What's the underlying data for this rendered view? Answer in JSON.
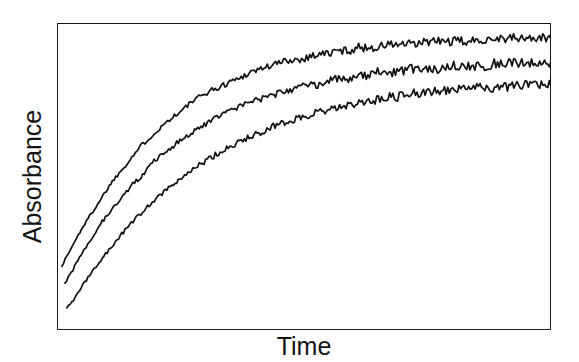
{
  "chart_data": {
    "type": "line",
    "title": "",
    "subtitle": "",
    "xlabel": "Time",
    "ylabel": "Absorbance",
    "xlim": [
      0,
      100
    ],
    "ylim": [
      0,
      100
    ],
    "grid": false,
    "legend": "none",
    "axis_ticks": "none",
    "annotations": [],
    "series": [
      {
        "name": "curve-1-upper",
        "color": "#111111",
        "plateau": 94,
        "rate": 0.052,
        "x_start": 1.0,
        "y_start": 21,
        "x": [
          1,
          3,
          5,
          7,
          9,
          11,
          13,
          15,
          17,
          19,
          21,
          23,
          25,
          27,
          29,
          31,
          33,
          35,
          37,
          39,
          41,
          43,
          45,
          47,
          49,
          51,
          53,
          55,
          57,
          59,
          61,
          63,
          65,
          67,
          69,
          71,
          73,
          75,
          77,
          79,
          81,
          83,
          85,
          87,
          89,
          91,
          93,
          95,
          97,
          99,
          100
        ],
        "values": [
          21,
          27,
          33,
          38,
          43,
          48,
          52,
          56,
          60,
          63,
          66,
          69,
          71,
          74,
          76,
          78,
          79,
          81,
          82,
          84,
          85,
          86,
          87,
          88,
          88,
          89,
          90,
          90,
          91,
          91,
          92,
          92,
          92,
          93,
          93,
          93,
          93,
          94,
          94,
          94,
          94,
          94,
          94,
          95,
          95,
          95,
          95,
          95,
          95,
          95,
          95
        ]
      },
      {
        "name": "curve-2-middle",
        "color": "#111111",
        "plateau": 86,
        "rate": 0.042,
        "x_start": 1.6,
        "y_start": 15,
        "x": [
          1.6,
          3,
          5,
          7,
          9,
          11,
          13,
          15,
          17,
          19,
          21,
          23,
          25,
          27,
          29,
          31,
          33,
          35,
          37,
          39,
          41,
          43,
          45,
          47,
          49,
          51,
          53,
          55,
          57,
          59,
          61,
          63,
          65,
          67,
          69,
          71,
          73,
          75,
          77,
          79,
          81,
          83,
          85,
          87,
          89,
          91,
          93,
          95,
          97,
          99,
          100
        ],
        "values": [
          15,
          19,
          25,
          30,
          35,
          39,
          43,
          47,
          50,
          54,
          57,
          59,
          62,
          64,
          66,
          68,
          70,
          71,
          73,
          74,
          75,
          76,
          77,
          78,
          79,
          80,
          80,
          81,
          82,
          82,
          83,
          83,
          84,
          84,
          84,
          85,
          85,
          85,
          85,
          86,
          86,
          86,
          86,
          86,
          87,
          87,
          87,
          87,
          87,
          87,
          87
        ]
      },
      {
        "name": "curve-3-lower",
        "color": "#111111",
        "plateau": 79,
        "rate": 0.033,
        "x_start": 2.0,
        "y_start": 7,
        "x": [
          2,
          3,
          5,
          7,
          9,
          11,
          13,
          15,
          17,
          19,
          21,
          23,
          25,
          27,
          29,
          31,
          33,
          35,
          37,
          39,
          41,
          43,
          45,
          47,
          49,
          51,
          53,
          55,
          57,
          59,
          61,
          63,
          65,
          67,
          69,
          71,
          73,
          75,
          77,
          79,
          81,
          83,
          85,
          87,
          89,
          91,
          93,
          95,
          97,
          99,
          100
        ],
        "values": [
          7,
          9,
          14,
          19,
          23,
          27,
          31,
          35,
          38,
          41,
          44,
          47,
          49,
          52,
          54,
          56,
          58,
          60,
          61,
          63,
          64,
          66,
          67,
          68,
          69,
          70,
          71,
          72,
          73,
          73,
          74,
          75,
          75,
          76,
          76,
          77,
          77,
          77,
          78,
          78,
          78,
          79,
          79,
          79,
          79,
          79,
          80,
          80,
          80,
          80,
          80
        ]
      }
    ]
  },
  "figure": {
    "background_color": "#ffffff",
    "frame_color": "#1a1a1a",
    "line_color": "#111111",
    "ylabel": "Absorbance",
    "xlabel": "Time"
  }
}
